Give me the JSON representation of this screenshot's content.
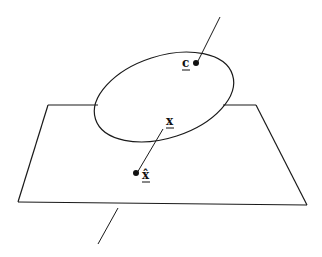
{
  "diagram": {
    "labels": {
      "c": "c",
      "x": "x",
      "x_hat": "x̂"
    },
    "colors": {
      "stroke": "#1a1a1a",
      "background": "#ffffff"
    }
  }
}
